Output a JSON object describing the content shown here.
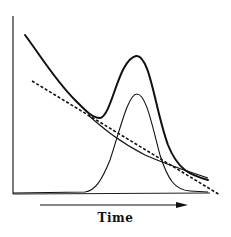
{
  "diagram": {
    "x_axis_label": "Time",
    "curves": [
      {
        "name": "total-signal",
        "style": "thick solid",
        "description": "decaying background plus peak"
      },
      {
        "name": "peak",
        "style": "thin solid",
        "description": "gaussian peak"
      },
      {
        "name": "background",
        "style": "thin solid",
        "description": "decaying baseline"
      },
      {
        "name": "linear-baseline",
        "style": "dashed",
        "description": "linear baseline estimate"
      }
    ],
    "colors": {
      "line": "#111111",
      "background": "#ffffff"
    }
  }
}
